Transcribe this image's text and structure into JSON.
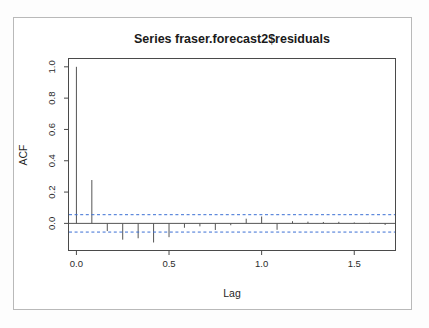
{
  "figure": {
    "kind": "acf-correlogram",
    "background_color": "#ffffff",
    "frame_color": "#4a4a4a",
    "spike_color": "#555555",
    "confidence_color": "#3b6fd4"
  },
  "chart_data": {
    "type": "bar",
    "title": "Series  fraser.forecast2$residuals",
    "xlabel": "Lag",
    "ylabel": "ACF",
    "xlim": [
      -0.04,
      1.72
    ],
    "ylim": [
      -0.17,
      1.05
    ],
    "xticks": [
      0.0,
      0.5,
      1.0,
      1.5
    ],
    "xtick_labels": [
      "0.0",
      "0.5",
      "1.0",
      "1.5"
    ],
    "yticks": [
      0.0,
      0.2,
      0.4,
      0.6,
      0.8,
      1.0
    ],
    "ytick_labels": [
      "0.0",
      "0.2",
      "0.4",
      "0.6",
      "0.8",
      "1.0"
    ],
    "grid": false,
    "legend": null,
    "lag_step": 0.0833333,
    "confidence_bounds": [
      0.0555,
      -0.0555
    ],
    "x": [
      0.0,
      0.0833,
      0.1667,
      0.25,
      0.3333,
      0.4167,
      0.5,
      0.5833,
      0.6667,
      0.75,
      0.8333,
      0.9167,
      1.0,
      1.0833,
      1.1667,
      1.25,
      1.3333,
      1.4167,
      1.5,
      1.5833,
      1.6667
    ],
    "values": [
      1.0,
      0.277,
      -0.049,
      -0.104,
      -0.095,
      -0.122,
      -0.088,
      -0.028,
      -0.019,
      -0.042,
      -0.012,
      0.03,
      0.044,
      -0.041,
      0.014,
      0.011,
      0.009,
      0.01,
      0.006,
      0.004,
      -0.01
    ],
    "categories": [
      "0.0000",
      "0.0833",
      "0.1667",
      "0.2500",
      "0.3333",
      "0.4167",
      "0.5000",
      "0.5833",
      "0.6667",
      "0.7500",
      "0.8333",
      "0.9167",
      "1.0000",
      "1.0833",
      "1.1667",
      "1.2500",
      "1.3333",
      "1.4167",
      "1.5000",
      "1.5833",
      "1.6667"
    ]
  }
}
